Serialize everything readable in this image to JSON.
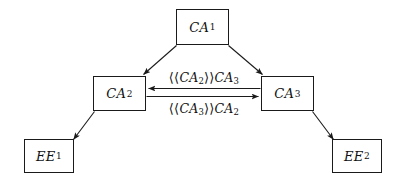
{
  "diagram": {
    "nodes": [
      {
        "id": "ca1",
        "base": "CA",
        "subscript": "1"
      },
      {
        "id": "ca2",
        "base": "CA",
        "subscript": "2"
      },
      {
        "id": "ca3",
        "base": "CA",
        "subscript": "3"
      },
      {
        "id": "ee1",
        "base": "EE",
        "subscript": "1"
      },
      {
        "id": "ee2",
        "base": "EE",
        "subscript": "2"
      }
    ],
    "edge_labels": {
      "ca2_to_ca3": {
        "open_bracket": "⟨⟨",
        "inner_base": "CA",
        "inner_subscript": "2",
        "close_bracket": "⟩⟩",
        "outer_base": "CA",
        "outer_subscript": "3",
        "full_text": "⟨⟨CA₂⟩⟩CA₃"
      },
      "ca3_to_ca2": {
        "open_bracket": "⟨⟨",
        "inner_base": "CA",
        "inner_subscript": "3",
        "close_bracket": "⟩⟩",
        "outer_base": "CA",
        "outer_subscript": "2",
        "full_text": "⟨⟨CA₃⟩⟩CA₂"
      }
    },
    "colors": {
      "stroke": "#1a1a1a",
      "background": "#ffffff",
      "text": "#111111"
    }
  }
}
